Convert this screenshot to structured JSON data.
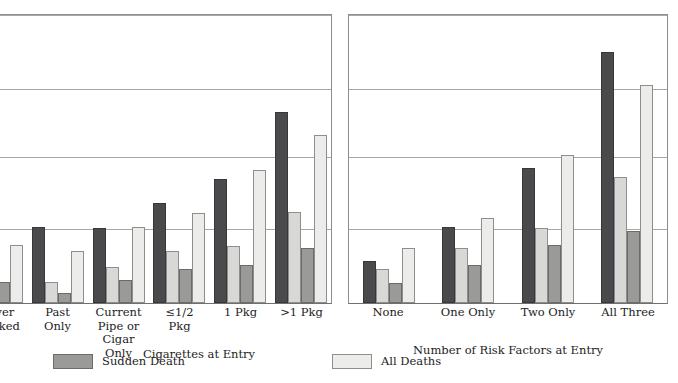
{
  "chart_data": [
    {
      "type": "bar",
      "panel": "left",
      "title": "",
      "xlabel": "Cigarettes at Entry",
      "ylabel": "",
      "ylim": [
        0,
        1.0
      ],
      "grid": true,
      "gridline_values": [
        1.0,
        0.745,
        0.51,
        0.26
      ],
      "legend_position": "bottom",
      "categories": [
        "Never\nSmoked",
        "Past\nOnly",
        "Current\nPipe or\nCigar\nOnly",
        "≤1/2\nPkg",
        "1 Pkg",
        ">1 Pkg"
      ],
      "series": [
        {
          "name": "Sudden Death (dark)",
          "color": "#4a4a4c",
          "values": [
            0.235,
            0.262,
            0.26,
            0.345,
            0.427,
            0.658
          ]
        },
        {
          "name": "All Deaths (light)",
          "color": "#d8d8d6",
          "values": [
            0.125,
            0.072,
            0.125,
            0.18,
            0.196,
            0.313
          ]
        },
        {
          "name": "Sudden Death (medium)",
          "color": "#9a9a99",
          "values": [
            0.072,
            0.035,
            0.079,
            0.116,
            0.131,
            0.19
          ]
        },
        {
          "name": "All Deaths (pale)",
          "color": "#ececeb",
          "values": [
            0.2,
            0.18,
            0.262,
            0.31,
            0.458,
            0.58
          ]
        }
      ]
    },
    {
      "type": "bar",
      "panel": "right",
      "title": "",
      "xlabel": "Number of Risk Factors at Entry",
      "ylabel": "",
      "ylim": [
        0,
        1.0
      ],
      "grid": true,
      "gridline_values": [
        1.0,
        0.745,
        0.51,
        0.26
      ],
      "legend_position": "bottom",
      "categories": [
        "None",
        "One Only",
        "Two Only",
        "All Three"
      ],
      "series": [
        {
          "name": "Sudden Death (dark)",
          "color": "#4a4a4c",
          "values": [
            0.145,
            0.262,
            0.466,
            0.866
          ]
        },
        {
          "name": "All Deaths (light)",
          "color": "#d8d8d6",
          "values": [
            0.117,
            0.19,
            0.259,
            0.434
          ]
        },
        {
          "name": "Sudden Death (medium)",
          "color": "#9a9a99",
          "values": [
            0.069,
            0.131,
            0.2,
            0.248
          ]
        },
        {
          "name": "All Deaths (pale)",
          "color": "#ececeb",
          "values": [
            0.19,
            0.293,
            0.51,
            0.752
          ]
        }
      ]
    }
  ],
  "legend": {
    "items": [
      {
        "label": "Sudden Death",
        "color": "#9a9a99"
      },
      {
        "label": "All Deaths",
        "color": "#ececeb"
      }
    ]
  }
}
